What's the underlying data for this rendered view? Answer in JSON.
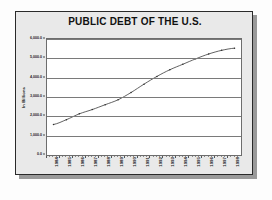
{
  "chart_data": {
    "type": "line",
    "title": "PUBLIC DEBT OF THE U.S.",
    "xlabel": "",
    "ylabel": "In Billions",
    "ylim": [
      0,
      6000
    ],
    "yticks": [
      0,
      1000,
      2000,
      3000,
      4000,
      5000,
      6000
    ],
    "ytick_labels": [
      "0.0",
      "1,000.0",
      "2,000.0",
      "3,000.0",
      "4,000.0",
      "5,000.0",
      "6,000.0"
    ],
    "grid": true,
    "legend": "none",
    "marker": "small-dot",
    "line_color": "#3a3a3a",
    "categories": [
      "1984",
      "1985",
      "1986",
      "1987",
      "1988",
      "1989",
      "1990",
      "1991",
      "1992",
      "1993",
      "1994",
      "1995",
      "1996",
      "1997",
      "1998"
    ],
    "x": [
      1984,
      1985,
      1986,
      1987,
      1988,
      1989,
      1990,
      1991,
      1992,
      1993,
      1994,
      1995,
      1996,
      1997,
      1998
    ],
    "values": [
      1577,
      1827,
      2130,
      2350,
      2602,
      2857,
      3233,
      3665,
      4065,
      4411,
      4693,
      4974,
      5225,
      5413,
      5526
    ],
    "series": [
      {
        "name": "Public Debt",
        "values": [
          1577,
          1827,
          2130,
          2350,
          2602,
          2857,
          3233,
          3665,
          4065,
          4411,
          4693,
          4974,
          5225,
          5413,
          5526
        ]
      }
    ]
  },
  "chart": {
    "title": "PUBLIC DEBT OF THE U.S.",
    "yaxis_title": "In Billions"
  }
}
